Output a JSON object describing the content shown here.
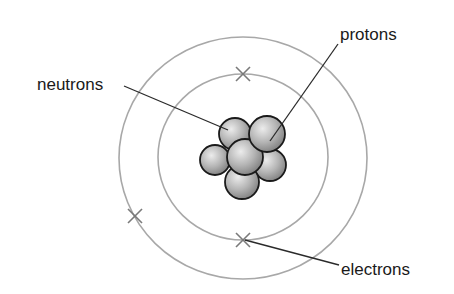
{
  "diagram": {
    "type": "atom-bohr-model",
    "labels": {
      "neutrons": "neutrons",
      "protons": "protons",
      "electrons": "electrons"
    },
    "colors": {
      "background": "#ffffff",
      "orbit": "#a8a8a8",
      "electron_mark": "#7a7a7a",
      "leader_line": "#2a2a2a",
      "nucleon_fill_light": "#e6e6e6",
      "nucleon_fill_dark": "#8c8c8c",
      "nucleon_stroke": "#1a1a1a",
      "text": "#1a1a1a"
    },
    "orbits": [
      {
        "name": "inner-shell",
        "cx": 243,
        "cy": 157,
        "rx": 85,
        "ry": 83
      },
      {
        "name": "outer-shell",
        "cx": 243,
        "cy": 158,
        "rx": 124,
        "ry": 121
      }
    ],
    "electrons": [
      {
        "name": "electron-inner-top",
        "x": 243,
        "y": 74
      },
      {
        "name": "electron-inner-bottom",
        "x": 243,
        "y": 240
      },
      {
        "name": "electron-outer-left",
        "x": 135,
        "y": 216
      }
    ],
    "nucleus": {
      "nucleons": [
        {
          "name": "nucleon-top-left",
          "cx": 235,
          "cy": 134,
          "r": 16
        },
        {
          "name": "nucleon-left",
          "cx": 215,
          "cy": 160,
          "r": 15
        },
        {
          "name": "nucleon-right",
          "cx": 270,
          "cy": 165,
          "r": 16
        },
        {
          "name": "nucleon-bottom",
          "cx": 242,
          "cy": 182,
          "r": 17
        },
        {
          "name": "nucleon-center",
          "cx": 245,
          "cy": 157,
          "r": 18
        },
        {
          "name": "nucleon-top-right",
          "cx": 267,
          "cy": 134,
          "r": 18
        }
      ]
    },
    "leader_lines": [
      {
        "name": "neutrons-leader",
        "x1": 124,
        "y1": 86,
        "x2": 228,
        "y2": 130
      },
      {
        "name": "protons-leader",
        "x1": 338,
        "y1": 44,
        "x2": 270,
        "y2": 141
      },
      {
        "name": "electrons-leader",
        "x1": 245,
        "y1": 240,
        "x2": 339,
        "y2": 265
      }
    ]
  }
}
